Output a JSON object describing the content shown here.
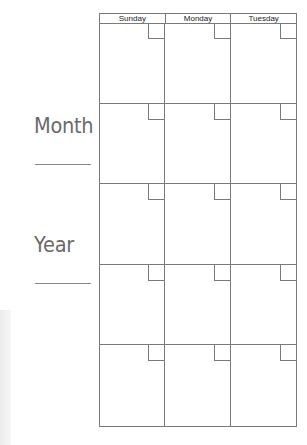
{
  "labels": {
    "month": "Month",
    "year": "Year"
  },
  "calendar": {
    "days": [
      "Sunday",
      "Monday",
      "Tuesday"
    ],
    "weeks": 5
  },
  "colors": {
    "grid_line": "#7a7a7a",
    "label_text": "#6a6a6a"
  }
}
